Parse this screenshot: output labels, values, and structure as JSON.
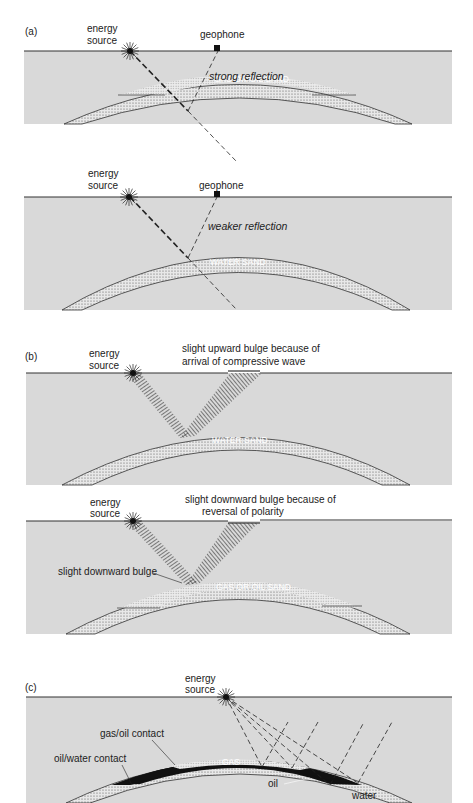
{
  "figure": {
    "colors": {
      "ground": "#d9d9d9",
      "sand_dots": "#555555",
      "oil": "#111111",
      "line": "#222222"
    },
    "panel_a": {
      "label": "(a)",
      "top": {
        "energy_source": [
          "energy",
          "source"
        ],
        "geophone": "geophone",
        "reflection": "strong reflection",
        "zone": "GAS OR OIL SAND"
      },
      "bottom": {
        "energy_source": [
          "energy",
          "source"
        ],
        "geophone": "geophone",
        "reflection": "weaker reflection",
        "zone": "WATER SAND"
      }
    },
    "panel_b": {
      "label": "(b)",
      "top": {
        "energy_source": [
          "energy",
          "source"
        ],
        "note": [
          "slight upward bulge because of",
          "arrival of compressive wave"
        ],
        "zone": "WATER SAND"
      },
      "bottom": {
        "energy_source": [
          "energy",
          "source"
        ],
        "note": [
          "slight downward bulge because of",
          "reversal of polarity"
        ],
        "bulge": "slight downward bulge",
        "zone": "GAS OR OIL SAND"
      }
    },
    "panel_c": {
      "label": "(c)",
      "energy_source": [
        "energy",
        "source"
      ],
      "gas_oil_contact": "gas/oil contact",
      "oil_water_contact": "oil/water contact",
      "gas": "GAS",
      "oil": "oil",
      "water": "water"
    }
  }
}
